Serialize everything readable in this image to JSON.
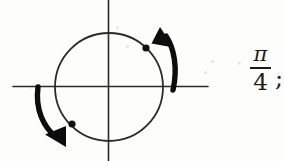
{
  "figure": {
    "background_color": "#fdfdfc",
    "ink_color": "#1a1a1a",
    "axes": {
      "x_axis": {
        "x1": 13,
        "y1": 86.5,
        "x2": 208,
        "y2": 86.5,
        "stroke_width": 1.6
      },
      "y_axis": {
        "x1": 108.5,
        "y1": 0,
        "x2": 108.5,
        "y2": 161,
        "stroke_width": 1.6
      }
    },
    "circle": {
      "cx": 109,
      "cy": 87,
      "r": 54,
      "stroke_width": 1.8,
      "fill": "none"
    },
    "points": [
      {
        "name": "terminal-point-upper-right",
        "cx": 146,
        "cy": 48,
        "r": 3.6,
        "angle_deg": 45
      },
      {
        "name": "terminal-point-lower-left",
        "cx": 72,
        "cy": 124,
        "r": 3.6,
        "angle_deg": 225
      }
    ],
    "arrows": [
      {
        "name": "counterclockwise-arrow-upper-right",
        "direction": "counterclockwise",
        "path": "M 172 89 C 176 66 172 47 164 35",
        "head": [
          [
            162,
            28
          ],
          [
            173,
            46
          ],
          [
            153,
            41
          ]
        ],
        "stroke_width": 5.2
      },
      {
        "name": "clockwise-arrow-lower-left",
        "direction": "clockwise",
        "path": "M 38 88 C 36 110 44 126 56 136",
        "head": [
          [
            64,
            145
          ],
          [
            47,
            133
          ],
          [
            67,
            128
          ]
        ],
        "stroke_width": 5.2
      }
    ],
    "specks": [
      {
        "x": 116,
        "y": 26,
        "size": 3
      },
      {
        "x": 126,
        "y": 45,
        "size": 3
      },
      {
        "x": 211,
        "y": 60,
        "size": 3
      },
      {
        "x": 204,
        "y": 71,
        "size": 3
      },
      {
        "x": 238,
        "y": 62,
        "size": 3
      },
      {
        "x": 30,
        "y": 87,
        "size": 2
      }
    ]
  },
  "label": {
    "name": "angle-measure-label",
    "numerator": "π",
    "denominator": "4",
    "punctuation": ";",
    "full_text": "π/4 ;"
  }
}
